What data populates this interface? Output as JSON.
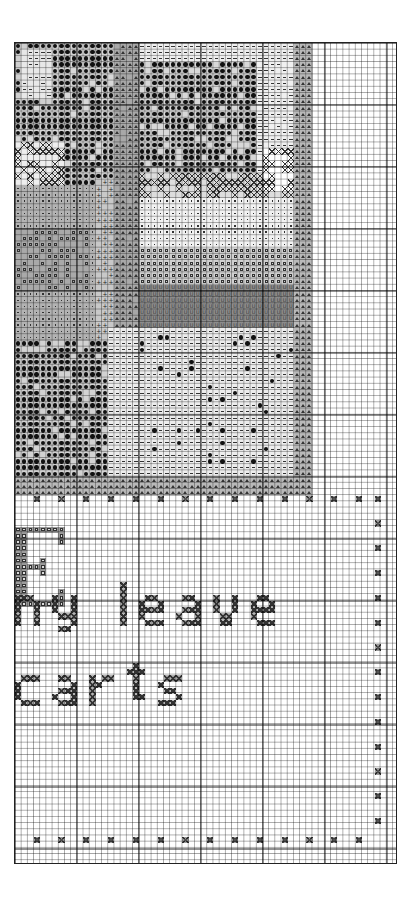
{
  "chart_data": {
    "type": "table",
    "title": "Cross-stitch pattern chart (partial page)",
    "grid": {
      "columns": 62,
      "rows": 133,
      "cell_px": 6.2,
      "major_line_every": 10,
      "origin_px": [
        14,
        42
      ],
      "size_px": [
        383,
        822
      ]
    },
    "colors": {
      "background": "#ffffff",
      "grid_minor": "#8a8a8a",
      "grid_major": "#222222",
      "shade_light": "#e6e6e6",
      "shade_mid": "#bdbdbd",
      "shade_dark": "#8f8f8f",
      "symbol": "#111111"
    },
    "symbols": [
      {
        "key": "dot",
        "glyph": "●",
        "meaning": "dark filled stitch"
      },
      {
        "key": "dash",
        "glyph": "–",
        "meaning": "light stitch"
      },
      {
        "key": "tri",
        "glyph": "△",
        "meaning": "mid-grey stitch"
      },
      {
        "key": "sq",
        "glyph": "□",
        "meaning": "grey square stitch"
      },
      {
        "key": "pt",
        "glyph": "·",
        "meaning": "pale stitch"
      },
      {
        "key": "plus",
        "glyph": "+",
        "meaning": "plus stitch"
      },
      {
        "key": "u",
        "glyph": "U",
        "meaning": "U stitch"
      },
      {
        "key": "x",
        "glyph": "✕",
        "meaning": "cross stitch outline"
      },
      {
        "key": "mark",
        "glyph": "⊗",
        "meaning": "border marker stitch"
      },
      {
        "key": "lx",
        "glyph": "✕",
        "meaning": "lettering stitch"
      },
      {
        "key": "bsq",
        "glyph": "▣",
        "meaning": "letter E stitch"
      }
    ],
    "regions": [
      {
        "name": "upper-left-foliage",
        "sym": "dot",
        "c": 0,
        "r": 0,
        "w": 6,
        "h": 10,
        "shade": "#cfcfcf",
        "density": 0.55
      },
      {
        "name": "upper-left-dash",
        "sym": "dash",
        "c": 1,
        "r": 1,
        "w": 5,
        "h": 8,
        "shade": "#e8e8e8",
        "density": 0.5
      },
      {
        "name": "upper-dark-tree",
        "sym": "dot",
        "c": 6,
        "r": 0,
        "w": 10,
        "h": 24,
        "shade": "#d8d8d8",
        "density": 0.9
      },
      {
        "name": "upper-mid-dark",
        "sym": "dot",
        "c": 0,
        "r": 10,
        "w": 16,
        "h": 10,
        "shade": "#d8d8d8",
        "density": 0.9
      },
      {
        "name": "upper-right-dark-tree",
        "sym": "dot",
        "c": 20,
        "r": 0,
        "w": 19,
        "h": 21,
        "shade": "#d8d8d8",
        "density": 0.85
      },
      {
        "name": "upper-light-top",
        "sym": "dash",
        "c": 16,
        "r": 0,
        "w": 30,
        "h": 3,
        "shade": "#efefef",
        "density": 1
      },
      {
        "name": "sky-right",
        "sym": "dash",
        "c": 39,
        "r": 3,
        "w": 6,
        "h": 22,
        "shade": "#f0f0f0",
        "density": 0.8
      },
      {
        "name": "left-hatch",
        "sym": "x",
        "c": 0,
        "r": 16,
        "w": 8,
        "h": 7,
        "shade": "#eeeeee",
        "density": 0.5
      },
      {
        "name": "left-grey-field",
        "sym": "pt",
        "c": 0,
        "r": 23,
        "w": 14,
        "h": 27,
        "shade": "#b3b3b3",
        "density": 1
      },
      {
        "name": "trunk",
        "sym": "tri",
        "c": 16,
        "r": 0,
        "w": 4,
        "h": 50,
        "shade": "#a8a8a8",
        "density": 0.9
      },
      {
        "name": "trunk-plus",
        "sym": "plus",
        "c": 13,
        "r": 22,
        "w": 3,
        "h": 26,
        "shade": "#c8c8c8",
        "density": 0.7
      },
      {
        "name": "roof-hatch",
        "sym": "x",
        "c": 20,
        "r": 21,
        "w": 25,
        "h": 4,
        "shade": "#dddddd",
        "density": 0.8
      },
      {
        "name": "right-bush-hatch",
        "sym": "x",
        "c": 40,
        "r": 17,
        "w": 6,
        "h": 7,
        "shade": "#ffffff",
        "density": 0.6
      },
      {
        "name": "building-face",
        "sym": "pt",
        "c": 20,
        "r": 25,
        "w": 25,
        "h": 8,
        "shade": "#f2f2f2",
        "density": 1
      },
      {
        "name": "building-base",
        "sym": "sq",
        "c": 20,
        "r": 33,
        "w": 25,
        "h": 6,
        "shade": "#d0d0d0",
        "density": 1
      },
      {
        "name": "water-band",
        "sym": "u",
        "c": 20,
        "r": 39,
        "w": 25,
        "h": 7,
        "shade": "#8c8c8c",
        "density": 1
      },
      {
        "name": "left-lower-sq",
        "sym": "sq",
        "c": 0,
        "r": 30,
        "w": 12,
        "h": 10,
        "shade": "#a9a9a9",
        "density": 0.6
      },
      {
        "name": "lower-left-dark",
        "sym": "dot",
        "c": 0,
        "r": 48,
        "w": 15,
        "h": 22,
        "shade": "#d2d2d2",
        "density": 0.85
      },
      {
        "name": "lower-ground",
        "sym": "dash",
        "c": 15,
        "r": 46,
        "w": 30,
        "h": 24,
        "shade": "#ededed",
        "density": 1
      },
      {
        "name": "lower-scattered-dots",
        "sym": "dot",
        "c": 20,
        "r": 47,
        "w": 25,
        "h": 22,
        "shade": "transparent",
        "density": 0.06
      },
      {
        "name": "right-tri-band",
        "sym": "tri",
        "c": 45,
        "r": 0,
        "w": 3,
        "h": 70,
        "shade": "#b9b9b9",
        "density": 1
      },
      {
        "name": "bottom-tri-border",
        "sym": "tri",
        "c": 0,
        "r": 70,
        "w": 48,
        "h": 3,
        "shade": "#b9b9b9",
        "density": 1
      }
    ],
    "border_markers": {
      "top_row": 73,
      "bottom_row": 128,
      "right_col": 58,
      "spacing_cells": 4,
      "first_col": 3
    },
    "letter_E": {
      "c": 0,
      "r": 78,
      "w": 8,
      "h": 13
    },
    "text_fragments": [
      {
        "text": "ny leave",
        "row": 89,
        "col": 0,
        "height_rows": 7
      },
      {
        "text": "carts",
        "row": 102,
        "col": 0,
        "height_rows": 7
      }
    ]
  }
}
